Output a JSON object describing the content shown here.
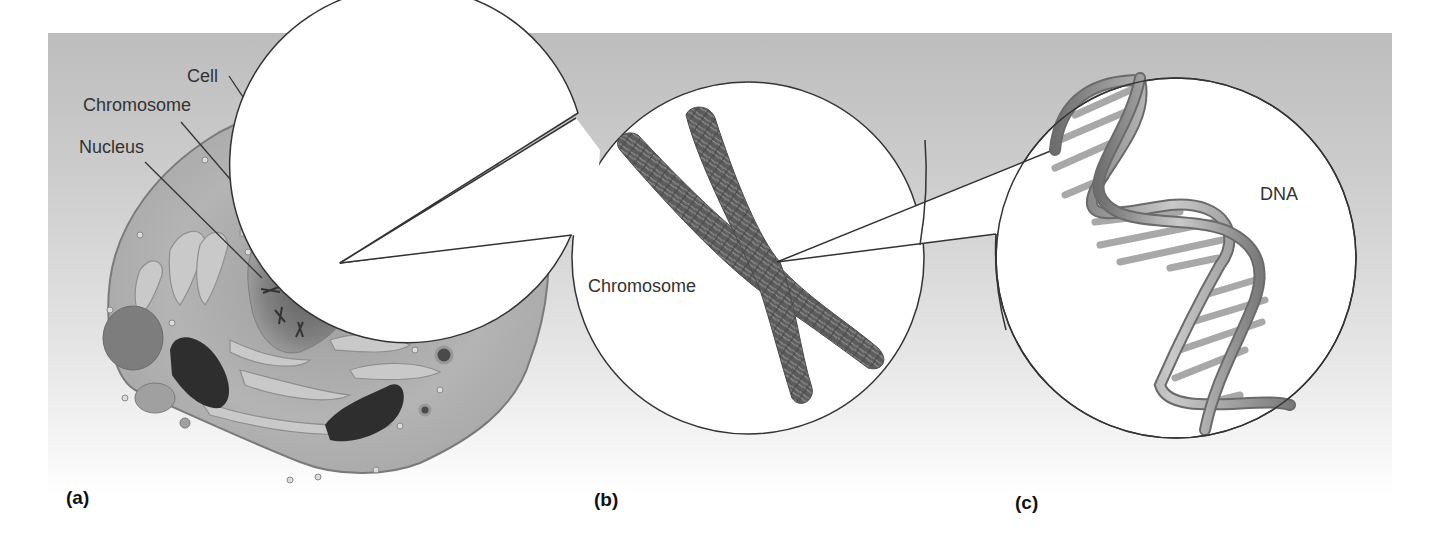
{
  "figure": {
    "panels": [
      {
        "id": "a",
        "label": "(a)",
        "subject": "Cell",
        "annotations": [
          {
            "text": "Cell"
          },
          {
            "text": "Chromosome"
          },
          {
            "text": "Nucleus"
          }
        ]
      },
      {
        "id": "b",
        "label": "(b)",
        "subject": "Chromosome",
        "annotation": "Chromosome"
      },
      {
        "id": "c",
        "label": "(c)",
        "subject": "DNA",
        "annotation": "DNA"
      }
    ],
    "colors": {
      "background_top": "#bdbdbd",
      "background_bottom": "#ffffff",
      "cell_fill": "#b8b8b8",
      "organelle_dark": "#2a2a2a",
      "callout_fill": "#ffffff",
      "outline": "#333333"
    }
  }
}
